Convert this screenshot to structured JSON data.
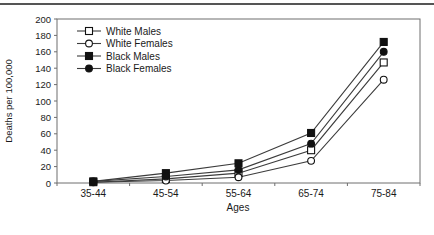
{
  "chart_data": {
    "type": "line",
    "categories": [
      "35-44",
      "45-54",
      "55-64",
      "65-74",
      "75-84"
    ],
    "series": [
      {
        "name": "White Males",
        "marker": "square",
        "fill": "open",
        "values": [
          1,
          5,
          12,
          40,
          147
        ]
      },
      {
        "name": "White Females",
        "marker": "circle",
        "fill": "open",
        "values": [
          1,
          3,
          7,
          27,
          126
        ]
      },
      {
        "name": "Black Males",
        "marker": "square",
        "fill": "solid",
        "values": [
          2,
          12,
          24,
          61,
          172
        ]
      },
      {
        "name": "Black Females",
        "marker": "circle",
        "fill": "solid",
        "values": [
          2,
          8,
          16,
          48,
          160
        ]
      }
    ],
    "title": "",
    "xlabel": "Ages",
    "ylabel": "Deaths per 100,000",
    "ylim": [
      0,
      200
    ],
    "ytick_step": 20,
    "yticks": [
      "0",
      "20",
      "40",
      "60",
      "80",
      "100",
      "120",
      "140",
      "160",
      "180",
      "200"
    ],
    "grid": false,
    "legend_position": "top-left",
    "colors": {
      "line": "#3c3c3c",
      "marker": "#111111",
      "marker_open_fill": "#ffffff",
      "frame": "#6e6e6e",
      "text": "#1a1a1a",
      "top_rule": "#555555",
      "background": "#ffffff"
    }
  }
}
